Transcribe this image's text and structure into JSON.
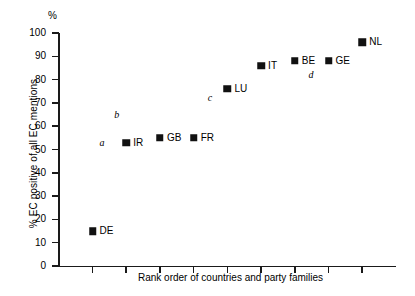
{
  "chart_data": {
    "type": "scatter",
    "title": "",
    "xlabel": "Rank order of countries and party families",
    "ylabel": "% EC positive of all EC mentions",
    "y_unit_label": "%",
    "ylim": [
      0,
      100
    ],
    "yticks": [
      0,
      10,
      20,
      30,
      40,
      50,
      60,
      70,
      80,
      90,
      100
    ],
    "ytick_labels": [
      "0",
      "10",
      "20",
      "30",
      "40",
      "50",
      "60",
      "70",
      "80",
      "90",
      "100"
    ],
    "xlim": [
      0,
      10
    ],
    "xticks": [
      1,
      2,
      3,
      4,
      5,
      6,
      7,
      8,
      9
    ],
    "xtick_labels": [
      "",
      "",
      "",
      "",
      "",
      "",
      "",
      "",
      ""
    ],
    "grid": false,
    "legend": false,
    "marker": "filled-square",
    "marker_color": "#111111",
    "categories": [
      "DE",
      "IR",
      "GB",
      "FR",
      "LU",
      "IT",
      "BE",
      "GE",
      "NL"
    ],
    "x": [
      1,
      2,
      3,
      4,
      5,
      6,
      7,
      8,
      9
    ],
    "values": [
      15,
      53,
      55,
      55,
      76,
      86,
      88,
      88,
      96
    ],
    "points": [
      {
        "label": "DE",
        "x": 1,
        "y": 15
      },
      {
        "label": "IR",
        "x": 2,
        "y": 53
      },
      {
        "label": "GB",
        "x": 3,
        "y": 55
      },
      {
        "label": "FR",
        "x": 4,
        "y": 55
      },
      {
        "label": "LU",
        "x": 5,
        "y": 76
      },
      {
        "label": "IT",
        "x": 6,
        "y": 86
      },
      {
        "label": "BE",
        "x": 7,
        "y": 88
      },
      {
        "label": "GE",
        "x": 8,
        "y": 88
      },
      {
        "label": "NL",
        "x": 9,
        "y": 96
      }
    ],
    "annotations": [
      {
        "text": "a",
        "x": 1.28,
        "y": 53
      },
      {
        "text": "b",
        "x": 1.72,
        "y": 65
      },
      {
        "text": "c",
        "x": 4.48,
        "y": 72
      },
      {
        "text": "d",
        "x": 7.48,
        "y": 82
      }
    ]
  }
}
